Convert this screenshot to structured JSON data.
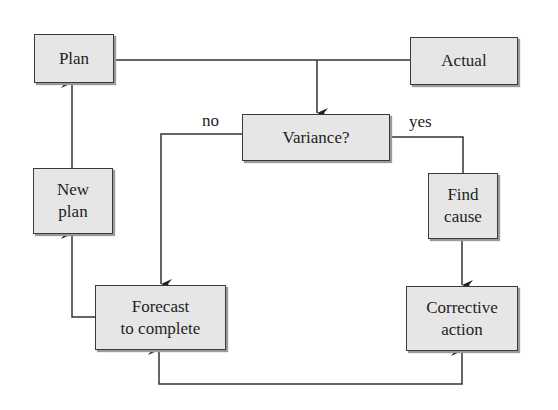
{
  "diagram": {
    "nodes": {
      "plan": "Plan",
      "actual": "Actual",
      "variance": "Variance?",
      "new_plan": "New plan",
      "find_cause": "Find cause",
      "forecast": "Forecast to complete",
      "corrective": "Corrective action"
    },
    "node_lines": {
      "new_plan": [
        "New",
        "plan"
      ],
      "find_cause": [
        "Find",
        "cause"
      ],
      "forecast": [
        "Forecast",
        "to complete"
      ],
      "corrective": [
        "Corrective",
        "action"
      ]
    },
    "edge_labels": {
      "no": "no",
      "yes": "yes"
    },
    "edges": [
      {
        "from": "Plan",
        "to": "Variance?"
      },
      {
        "from": "Actual",
        "to": "Variance?"
      },
      {
        "from": "Variance?",
        "to": "Forecast to complete",
        "label": "no"
      },
      {
        "from": "Variance?",
        "to": "Find cause",
        "label": "yes"
      },
      {
        "from": "Find cause",
        "to": "Corrective action"
      },
      {
        "from": "Forecast to complete",
        "to": "New plan"
      },
      {
        "from": "New plan",
        "to": "Plan"
      },
      {
        "from": "Corrective action",
        "to": "Forecast to complete",
        "bidirectional": true
      }
    ],
    "colors": {
      "box_fill": "#e6e6e6",
      "stroke": "#3a3a3a"
    }
  }
}
